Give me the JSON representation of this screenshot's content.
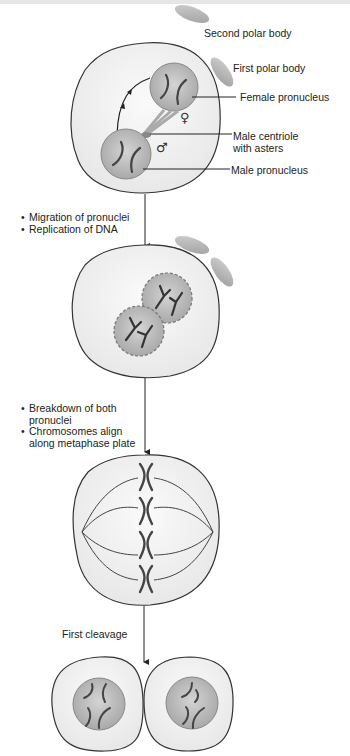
{
  "figure": {
    "colors": {
      "cell_fill": "#f3f3f3",
      "cell_stroke": "#333333",
      "nucleus_fill": "#b9b9b9",
      "polar_body_fill": "#bdbdbd",
      "chromosome": "#444444",
      "text": "#222222"
    },
    "stage1": {
      "labels": {
        "second_polar_body": "Second polar body",
        "first_polar_body": "First polar body",
        "female_pronucleus": "Female pronucleus",
        "male_centriole": "Male centriole",
        "male_centriole_2": "with asters",
        "male_pronucleus": "Male pronucleus"
      },
      "symbols": {
        "female": "♀",
        "male": "♂"
      }
    },
    "transition1": {
      "bullets": [
        "Migration of pronuclei",
        "Replication of DNA"
      ]
    },
    "transition2": {
      "bullets": [
        "Breakdown of both",
        "Chromosomes align"
      ],
      "bullet1_cont": "pronuclei",
      "bullet2_cont": "along metaphase plate"
    },
    "transition3": {
      "label": "First cleavage"
    }
  }
}
